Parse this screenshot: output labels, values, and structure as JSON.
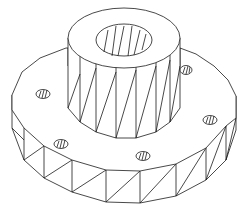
{
  "drawing": {
    "subject": "Flanged hub with center bore and bolt holes",
    "style": "isometric wireframe, black lines on white",
    "colors": {
      "background": "#ffffff",
      "line": "#1a1a1a"
    },
    "hub": {
      "center": [
        124,
        38
      ],
      "outer_rx": 56,
      "outer_ry": 30,
      "bore_rx": 28,
      "bore_ry": 16,
      "height": 100
    },
    "flange": {
      "center": [
        122,
        128
      ],
      "rx": 111,
      "ry": 80,
      "thickness": 30
    },
    "bolt_holes": [
      {
        "x": 43,
        "y": 94
      },
      {
        "x": 61,
        "y": 144
      },
      {
        "x": 143,
        "y": 156
      },
      {
        "x": 210,
        "y": 120
      },
      {
        "x": 184,
        "y": 70
      }
    ]
  }
}
